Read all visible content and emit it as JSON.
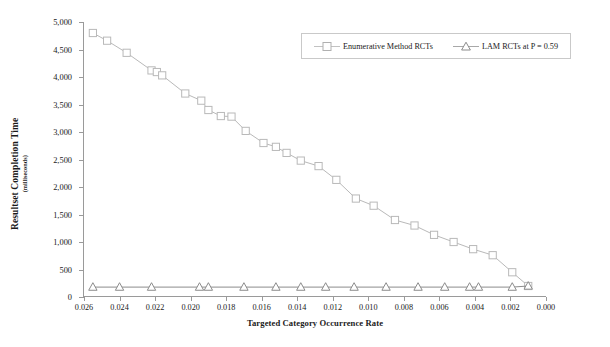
{
  "chart_data": {
    "type": "line",
    "title": "",
    "xlabel": "Targeted Category Occurrence Rate",
    "ylabel": "Resultset Completion Time",
    "ylabel_sub": "(milliseconds)",
    "xlim": [
      0.026,
      0.0
    ],
    "ylim": [
      0,
      5000
    ],
    "x_inverted": true,
    "grid": false,
    "legend_position": "top-right-inside",
    "xticks": [
      "0.026",
      "0.024",
      "0.022",
      "0.020",
      "0.018",
      "0.016",
      "0.014",
      "0.012",
      "0.010",
      "0.008",
      "0.006",
      "0.004",
      "0.002",
      "0.000"
    ],
    "xtick_values": [
      0.026,
      0.024,
      0.022,
      0.02,
      0.018,
      0.016,
      0.014,
      0.012,
      0.01,
      0.008,
      0.006,
      0.004,
      0.002,
      0.0
    ],
    "yticks": [
      "0",
      "500",
      "1,000",
      "1,500",
      "2,000",
      "2,500",
      "3,000",
      "3,500",
      "4,000",
      "4,500",
      "5,000"
    ],
    "ytick_values": [
      0,
      500,
      1000,
      1500,
      2000,
      2500,
      3000,
      3500,
      4000,
      4500,
      5000
    ],
    "series": [
      {
        "name": "Enumerative Method RCTs",
        "marker": "square",
        "color": "#b9b9b9",
        "x": [
          0.0255,
          0.0247,
          0.0236,
          0.0222,
          0.0219,
          0.0216,
          0.0203,
          0.0194,
          0.019,
          0.0183,
          0.0177,
          0.0169,
          0.0159,
          0.0152,
          0.0146,
          0.0138,
          0.0128,
          0.0118,
          0.0107,
          0.0097,
          0.0085,
          0.0074,
          0.0063,
          0.0052,
          0.0041,
          0.003,
          0.0019,
          0.001
        ],
        "values": [
          4800,
          4660,
          4440,
          4120,
          4090,
          4030,
          3700,
          3570,
          3400,
          3290,
          3280,
          3020,
          2800,
          2730,
          2620,
          2480,
          2380,
          2130,
          1790,
          1660,
          1400,
          1300,
          1130,
          1000,
          870,
          760,
          450,
          200
        ]
      },
      {
        "name": "LAM RCTs at P = 0.59",
        "marker": "triangle",
        "color": "#8c8c8c",
        "x": [
          0.0255,
          0.024,
          0.0222,
          0.0195,
          0.019,
          0.017,
          0.0152,
          0.0138,
          0.0124,
          0.0108,
          0.009,
          0.0072,
          0.0057,
          0.0043,
          0.0038,
          0.0019,
          0.001
        ],
        "values": [
          180,
          180,
          180,
          180,
          180,
          180,
          180,
          180,
          180,
          180,
          180,
          180,
          180,
          180,
          180,
          180,
          200
        ]
      }
    ]
  },
  "legend": {
    "items": [
      {
        "label": "Enumerative Method RCTs",
        "marker": "square-marker-icon"
      },
      {
        "label": "LAM RCTs at P = 0.59",
        "marker": "triangle-marker-icon"
      }
    ]
  }
}
